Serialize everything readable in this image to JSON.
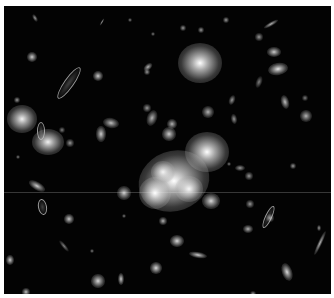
{
  "image": {
    "subject": "galaxy cluster deep field",
    "background_color": "#030303",
    "frame_color": "#ffffff",
    "frame": {
      "left": 4,
      "top": 6,
      "width": 327,
      "height": 288
    }
  },
  "galaxies": [
    {
      "x": 196,
      "y": 57,
      "rx": 22,
      "ry": 20,
      "b": 1.0,
      "r": 0
    },
    {
      "x": 18,
      "y": 113,
      "rx": 15,
      "ry": 14,
      "b": 0.95,
      "r": 0
    },
    {
      "x": 44,
      "y": 136,
      "rx": 16,
      "ry": 13,
      "b": 0.95,
      "r": 0
    },
    {
      "x": 203,
      "y": 146,
      "rx": 22,
      "ry": 20,
      "b": 1.0,
      "r": 0
    },
    {
      "x": 170,
      "y": 175,
      "rx": 36,
      "ry": 30,
      "b": 1.0,
      "r": -20
    },
    {
      "x": 151,
      "y": 187,
      "rx": 16,
      "ry": 16,
      "b": 1.0,
      "r": 0
    },
    {
      "x": 185,
      "y": 183,
      "rx": 14,
      "ry": 13,
      "b": 0.95,
      "r": 0
    },
    {
      "x": 159,
      "y": 166,
      "rx": 12,
      "ry": 11,
      "b": 0.9,
      "r": 0
    },
    {
      "x": 207,
      "y": 195,
      "rx": 9,
      "ry": 8,
      "b": 0.85,
      "r": 0
    },
    {
      "x": 165,
      "y": 128,
      "rx": 7,
      "ry": 7,
      "b": 0.8,
      "r": 0
    },
    {
      "x": 168,
      "y": 118,
      "rx": 5,
      "ry": 5,
      "b": 0.7,
      "r": 0
    },
    {
      "x": 204,
      "y": 106,
      "rx": 6,
      "ry": 6,
      "b": 0.7,
      "r": 0
    },
    {
      "x": 274,
      "y": 63,
      "rx": 10,
      "ry": 6,
      "b": 0.9,
      "r": -10
    },
    {
      "x": 270,
      "y": 46,
      "rx": 7,
      "ry": 5,
      "b": 0.8,
      "r": 0
    },
    {
      "x": 267,
      "y": 18,
      "rx": 8,
      "ry": 2,
      "b": 0.7,
      "r": -30
    },
    {
      "x": 255,
      "y": 31,
      "rx": 4,
      "ry": 4,
      "b": 0.6,
      "r": 0
    },
    {
      "x": 281,
      "y": 96,
      "rx": 4,
      "ry": 7,
      "b": 0.75,
      "r": -15
    },
    {
      "x": 302,
      "y": 110,
      "rx": 6,
      "ry": 6,
      "b": 0.7,
      "r": 0
    },
    {
      "x": 301,
      "y": 92,
      "rx": 3,
      "ry": 3,
      "b": 0.5,
      "r": 0
    },
    {
      "x": 255,
      "y": 76,
      "rx": 3,
      "ry": 6,
      "b": 0.5,
      "r": 20
    },
    {
      "x": 228,
      "y": 94,
      "rx": 3,
      "ry": 5,
      "b": 0.6,
      "r": 20
    },
    {
      "x": 230,
      "y": 113,
      "rx": 3,
      "ry": 5,
      "b": 0.6,
      "r": -10
    },
    {
      "x": 94,
      "y": 70,
      "rx": 5,
      "ry": 5,
      "b": 0.8,
      "r": 0
    },
    {
      "x": 97,
      "y": 128,
      "rx": 5,
      "ry": 8,
      "b": 0.8,
      "r": 0
    },
    {
      "x": 107,
      "y": 117,
      "rx": 8,
      "ry": 5,
      "b": 0.75,
      "r": 10
    },
    {
      "x": 148,
      "y": 112,
      "rx": 5,
      "ry": 8,
      "b": 0.7,
      "r": 20
    },
    {
      "x": 143,
      "y": 102,
      "rx": 4,
      "ry": 4,
      "b": 0.6,
      "r": 0
    },
    {
      "x": 28,
      "y": 51,
      "rx": 5,
      "ry": 5,
      "b": 0.8,
      "r": 0
    },
    {
      "x": 31,
      "y": 12,
      "rx": 2,
      "ry": 4,
      "b": 0.6,
      "r": -30
    },
    {
      "x": 98,
      "y": 16,
      "rx": 1,
      "ry": 4,
      "b": 0.6,
      "r": 30
    },
    {
      "x": 144,
      "y": 61,
      "rx": 3,
      "ry": 5,
      "b": 0.7,
      "r": 50
    },
    {
      "x": 143,
      "y": 66,
      "rx": 3,
      "ry": 3,
      "b": 0.6,
      "r": 0
    },
    {
      "x": 13,
      "y": 94,
      "rx": 3,
      "ry": 3,
      "b": 0.6,
      "r": 0
    },
    {
      "x": 66,
      "y": 137,
      "rx": 4,
      "ry": 4,
      "b": 0.6,
      "r": 0
    },
    {
      "x": 58,
      "y": 124,
      "rx": 3,
      "ry": 3,
      "b": 0.5,
      "r": 0
    },
    {
      "x": 120,
      "y": 187,
      "rx": 7,
      "ry": 7,
      "b": 0.8,
      "r": 0
    },
    {
      "x": 65,
      "y": 213,
      "rx": 5,
      "ry": 5,
      "b": 0.8,
      "r": 0
    },
    {
      "x": 33,
      "y": 180,
      "rx": 9,
      "ry": 4,
      "b": 0.8,
      "r": 30
    },
    {
      "x": 152,
      "y": 262,
      "rx": 6,
      "ry": 6,
      "b": 0.85,
      "r": 0
    },
    {
      "x": 117,
      "y": 273,
      "rx": 3,
      "ry": 6,
      "b": 0.8,
      "r": 0
    },
    {
      "x": 94,
      "y": 275,
      "rx": 7,
      "ry": 7,
      "b": 0.85,
      "r": 0
    },
    {
      "x": 22,
      "y": 286,
      "rx": 4,
      "ry": 4,
      "b": 0.75,
      "r": 0
    },
    {
      "x": 6,
      "y": 254,
      "rx": 4,
      "ry": 5,
      "b": 0.8,
      "r": 0
    },
    {
      "x": 173,
      "y": 235,
      "rx": 7,
      "ry": 6,
      "b": 0.85,
      "r": 0
    },
    {
      "x": 159,
      "y": 215,
      "rx": 4,
      "ry": 4,
      "b": 0.7,
      "r": 0
    },
    {
      "x": 194,
      "y": 249,
      "rx": 9,
      "ry": 3,
      "b": 0.8,
      "r": 10
    },
    {
      "x": 246,
      "y": 198,
      "rx": 4,
      "ry": 4,
      "b": 0.6,
      "r": 0
    },
    {
      "x": 266,
      "y": 212,
      "rx": 4,
      "ry": 4,
      "b": 0.65,
      "r": 0
    },
    {
      "x": 244,
      "y": 223,
      "rx": 5,
      "ry": 4,
      "b": 0.7,
      "r": 0
    },
    {
      "x": 283,
      "y": 266,
      "rx": 5,
      "ry": 9,
      "b": 0.85,
      "r": -20
    },
    {
      "x": 316,
      "y": 237,
      "rx": 2,
      "ry": 13,
      "b": 0.7,
      "r": 25
    },
    {
      "x": 315,
      "y": 222,
      "rx": 2,
      "ry": 3,
      "b": 0.6,
      "r": 0
    },
    {
      "x": 249,
      "y": 288,
      "rx": 3,
      "ry": 3,
      "b": 0.6,
      "r": 0
    },
    {
      "x": 245,
      "y": 170,
      "rx": 4,
      "ry": 4,
      "b": 0.6,
      "r": 0
    },
    {
      "x": 289,
      "y": 160,
      "rx": 3,
      "ry": 3,
      "b": 0.6,
      "r": 0
    },
    {
      "x": 225,
      "y": 158,
      "rx": 2,
      "ry": 2,
      "b": 0.5,
      "r": 0
    },
    {
      "x": 236,
      "y": 162,
      "rx": 5,
      "ry": 3,
      "b": 0.6,
      "r": 0
    },
    {
      "x": 222,
      "y": 14,
      "rx": 3,
      "ry": 3,
      "b": 0.6,
      "r": 0
    },
    {
      "x": 197,
      "y": 24,
      "rx": 3,
      "ry": 3,
      "b": 0.6,
      "r": 0
    },
    {
      "x": 179,
      "y": 22,
      "rx": 3,
      "ry": 3,
      "b": 0.6,
      "r": 0
    },
    {
      "x": 126,
      "y": 14,
      "rx": 2,
      "ry": 2,
      "b": 0.5,
      "r": 0
    },
    {
      "x": 149,
      "y": 28,
      "rx": 2,
      "ry": 2,
      "b": 0.5,
      "r": 0
    },
    {
      "x": 60,
      "y": 240,
      "rx": 2,
      "ry": 7,
      "b": 0.5,
      "r": -40
    },
    {
      "x": 14,
      "y": 151,
      "rx": 2,
      "ry": 2,
      "b": 0.5,
      "r": 0
    },
    {
      "x": 120,
      "y": 210,
      "rx": 2,
      "ry": 2,
      "b": 0.5,
      "r": 0
    },
    {
      "x": 88,
      "y": 245,
      "rx": 2,
      "ry": 2,
      "b": 0.5,
      "r": 0
    }
  ],
  "arcs": [
    {
      "x": 64,
      "y": 76,
      "w": 8,
      "h": 36,
      "r": 35
    },
    {
      "x": 36,
      "y": 124,
      "w": 6,
      "h": 16,
      "r": 0
    },
    {
      "x": 37,
      "y": 200,
      "w": 7,
      "h": 14,
      "r": -10
    },
    {
      "x": 263,
      "y": 210,
      "w": 5,
      "h": 22,
      "r": 25
    }
  ]
}
